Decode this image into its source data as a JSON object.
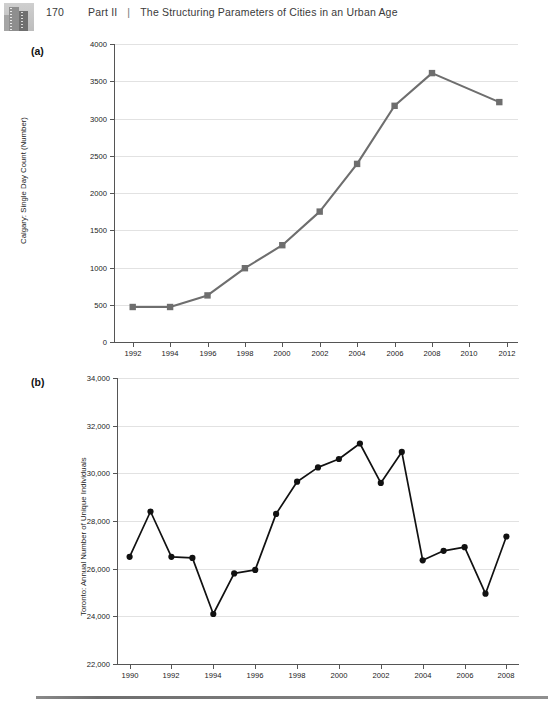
{
  "header": {
    "page_number": "170",
    "part": "Part II",
    "separator": "|",
    "title": "The Structuring Parameters of Cities in an Urban Age",
    "thumbnail_icon": "cityscape-thumbnail"
  },
  "panels": {
    "a_label": "(a)",
    "b_label": "(b)"
  },
  "footer": {
    "rule": "horizontal-rule"
  },
  "chart_data": [
    {
      "id": "chart-a",
      "type": "line",
      "title": "",
      "xlabel": "",
      "ylabel": "Calgary: Single Day Count (Number)",
      "series_color": "#6e6e6e",
      "marker": "square",
      "xlim": [
        1991,
        2012.6
      ],
      "ylim": [
        0,
        4000
      ],
      "ytick_values": [
        0,
        500,
        1000,
        1500,
        2000,
        2500,
        3000,
        3500,
        4000
      ],
      "ytick_labels": [
        "0",
        "500",
        "1000",
        "1500",
        "2000",
        "2500",
        "3000",
        "3500",
        "4000"
      ],
      "xtick_values": [
        1992,
        1994,
        1996,
        1998,
        2000,
        2002,
        2004,
        2006,
        2008,
        2010,
        2012
      ],
      "xtick_labels": [
        "1992",
        "1994",
        "1996",
        "1998",
        "2000",
        "2002",
        "2004",
        "2006",
        "2008",
        "2010",
        "2012"
      ],
      "grid": true,
      "legend": "none",
      "x": [
        1992,
        1994,
        1996,
        1998,
        2000,
        2002,
        2004,
        2006,
        2008,
        2011.6
      ],
      "values": [
        470,
        470,
        625,
        990,
        1300,
        1750,
        2390,
        3170,
        3610,
        3220
      ]
    },
    {
      "id": "chart-b",
      "type": "line",
      "title": "",
      "xlabel": "",
      "ylabel": "Toronto: Annual Number of Unique Individuals",
      "series_color": "#111111",
      "marker": "circle",
      "xlim": [
        1989.4,
        2008.6
      ],
      "ylim": [
        22000,
        34000
      ],
      "ytick_values": [
        22000,
        24000,
        26000,
        28000,
        30000,
        32000,
        34000
      ],
      "ytick_labels": [
        "22,000",
        "24,000",
        "26,000",
        "28,000",
        "30,000",
        "32,000",
        "34,000"
      ],
      "xtick_values": [
        1990,
        1992,
        1994,
        1996,
        1998,
        2000,
        2002,
        2004,
        2006,
        2008
      ],
      "xtick_labels": [
        "1990",
        "1992",
        "1994",
        "1996",
        "1998",
        "2000",
        "2002",
        "2004",
        "2006",
        "2008"
      ],
      "grid": true,
      "legend": "none",
      "x": [
        1990,
        1991,
        1992,
        1993,
        1994,
        1995,
        1996,
        1997,
        1998,
        1999,
        2000,
        2001,
        2002,
        2003,
        2004,
        2005,
        2006,
        2007,
        2008
      ],
      "values": [
        26500,
        28400,
        26500,
        26450,
        24100,
        25800,
        25950,
        28300,
        29650,
        30250,
        30600,
        31250,
        29600,
        30900,
        26350,
        26750,
        26900,
        24950,
        27350
      ]
    }
  ]
}
